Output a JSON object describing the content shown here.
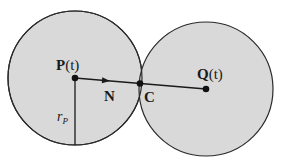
{
  "diagram": {
    "type": "two tangent circles",
    "colors": {
      "fill": "#d9d9d9",
      "stroke": "#2a2a2a",
      "background": "#ffffff"
    },
    "circle_p": {
      "center_label_main": "P",
      "center_label_arg": "(t)",
      "radius_label": "r",
      "radius_subscript": "P",
      "cx": 75,
      "cy": 78,
      "r": 67
    },
    "circle_q": {
      "center_label_main": "Q",
      "center_label_arg": "(t)",
      "cx": 206,
      "cy": 89,
      "r": 67
    },
    "contact_point": {
      "label": "C",
      "x": 140,
      "y": 83
    },
    "normal_vector": {
      "label": "N"
    }
  }
}
